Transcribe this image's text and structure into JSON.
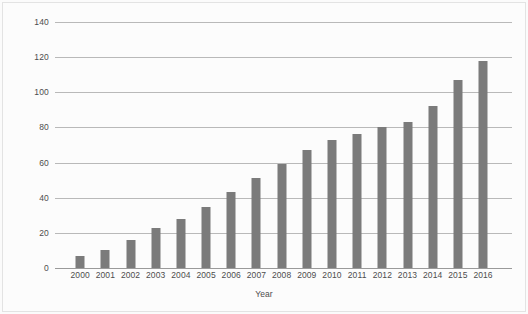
{
  "chart_data": {
    "type": "bar",
    "title": "",
    "xlabel": "Year",
    "ylabel": "Passenger numbers (millions)",
    "categories": [
      "2000",
      "2001",
      "2002",
      "2003",
      "2004",
      "2005",
      "2006",
      "2007",
      "2008",
      "2009",
      "2010",
      "2011",
      "2012",
      "2013",
      "2014",
      "2015",
      "2016"
    ],
    "values": [
      7,
      10,
      16,
      23,
      28,
      35,
      43,
      51,
      59,
      67,
      73,
      76,
      80,
      83,
      92,
      107,
      118
    ],
    "ylim": [
      0,
      140
    ],
    "ytick_labels": [
      "0",
      "20",
      "40",
      "60",
      "80",
      "100",
      "120",
      "140"
    ],
    "ytick_values": [
      0,
      20,
      40,
      60,
      80,
      100,
      120,
      140
    ],
    "grid": true,
    "legend": false,
    "bar_color": "#7b7b7b",
    "gridline_color": "#b9b9b9",
    "axis_color": "#9a9a9a",
    "background_color": "#fcfcfc",
    "text_color": "#4d4d4d"
  }
}
